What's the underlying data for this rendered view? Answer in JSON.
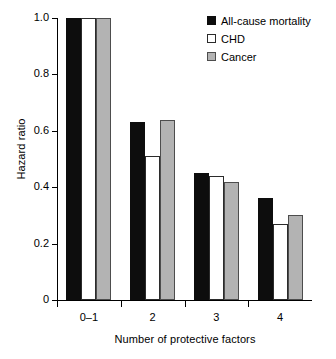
{
  "chart_data": {
    "type": "bar",
    "title": "",
    "subtitle": "",
    "xlabel": "Number of protective factors",
    "ylabel": "Hazard ratio",
    "categories": [
      "0–1",
      "2",
      "3",
      "4"
    ],
    "series": [
      {
        "name": "All-cause mortality",
        "color": "#0d0d0d",
        "values": [
          1.0,
          0.63,
          0.45,
          0.36
        ]
      },
      {
        "name": "CHD",
        "color": "#ffffff",
        "values": [
          1.0,
          0.51,
          0.44,
          0.27
        ]
      },
      {
        "name": "Cancer",
        "color": "#b3b3b3",
        "values": [
          1.0,
          0.64,
          0.42,
          0.3
        ]
      }
    ],
    "ylim": [
      0,
      1.0
    ],
    "yticks": [
      0,
      0.2,
      0.4,
      0.6,
      0.8,
      1.0
    ],
    "ytick_labels": [
      "0",
      "0.2",
      "0.4",
      "0.6",
      "0.8",
      "1.0"
    ],
    "grid": false,
    "legend_position": "top-right"
  },
  "legend": {
    "entries": [
      {
        "label": "All-cause mortality"
      },
      {
        "label": "CHD"
      },
      {
        "label": "Cancer"
      }
    ]
  }
}
